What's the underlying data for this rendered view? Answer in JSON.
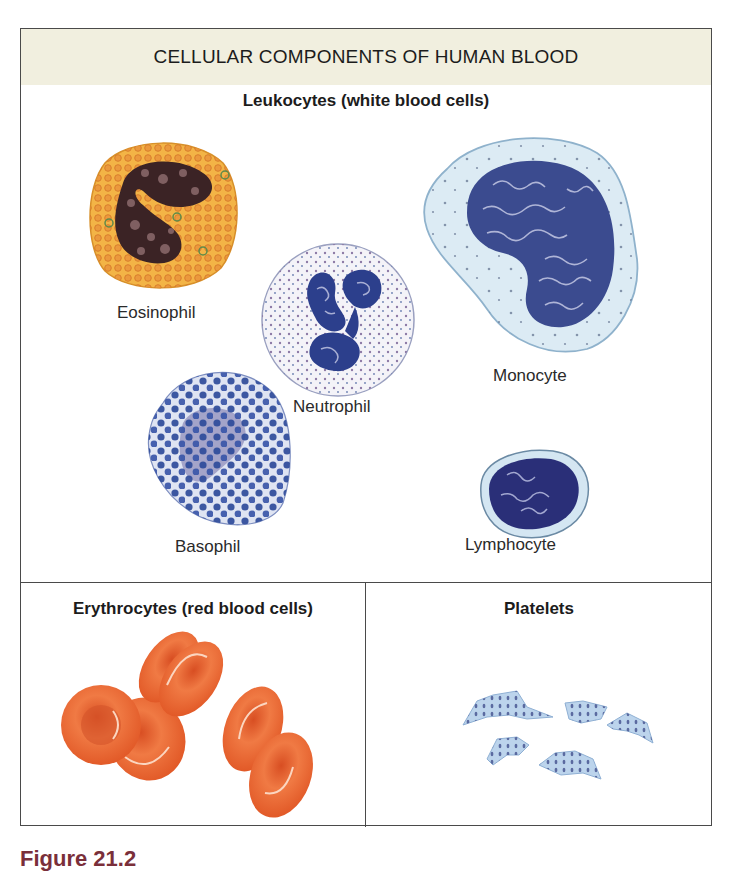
{
  "figure": {
    "title": "CELLULAR COMPONENTS OF HUMAN BLOOD",
    "header_color": "#f1efdf",
    "caption_partial": "Figure 21.2"
  },
  "leukocytes": {
    "title": "Leukocytes (white blood cells)",
    "cells": [
      {
        "name": "Eosinophil",
        "label": "Eosinophil",
        "colors": {
          "cytoplasm": "#f0a632",
          "granules": "#d9742a",
          "nucleus": "#3a2224"
        }
      },
      {
        "name": "Neutrophil",
        "label": "Neutrophil",
        "colors": {
          "cytoplasm": "#f2f2f8",
          "granules": "#8c7aa6",
          "nucleus": "#2c3f8c"
        }
      },
      {
        "name": "Monocyte",
        "label": "Monocyte",
        "colors": {
          "cytoplasm": "#d8e8f2",
          "nucleus": "#3b4b8f"
        }
      },
      {
        "name": "Basophil",
        "label": "Basophil",
        "colors": {
          "cytoplasm": "#c9d0e8",
          "granules": "#2e4b9a",
          "nucleus": "#8a89b8"
        }
      },
      {
        "name": "Lymphocyte",
        "label": "Lymphocyte",
        "colors": {
          "cytoplasm": "#d4e6f2",
          "nucleus": "#2a2f78"
        }
      }
    ]
  },
  "erythrocytes": {
    "title": "Erythrocytes (red blood cells)",
    "color": "#e8602c",
    "count": 6
  },
  "platelets": {
    "title": "Platelets",
    "color": "#b8d2ec",
    "count": 5
  }
}
